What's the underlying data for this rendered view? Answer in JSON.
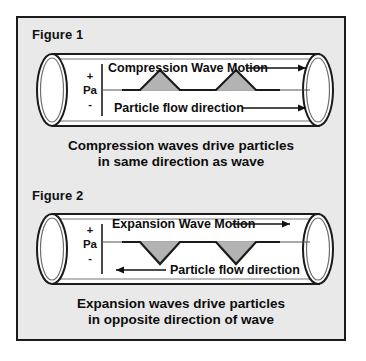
{
  "page": {
    "background": "#ffffff",
    "panel_background": "#e9e9e9",
    "panel_border_color": "#1b1b1b",
    "ink_color": "#111111",
    "wave_fill_color": "#b3b3b3",
    "tube_fill_color": "#ffffff"
  },
  "figures": [
    {
      "label": "Figure 1",
      "axis": {
        "positive": "+",
        "unit": "Pa",
        "negative": "-"
      },
      "wave_label": "Compression Wave Motion",
      "wave_arrow_direction": "right",
      "flow_label": "Particle flow direction",
      "flow_arrow_direction": "right",
      "wave_shape": "peaks-up",
      "wave_peak_count": 2,
      "caption_line1": "Compression waves drive particles",
      "caption_line2": "in same direction as wave"
    },
    {
      "label": "Figure 2",
      "axis": {
        "positive": "+",
        "unit": "Pa",
        "negative": "-"
      },
      "wave_label": "Expansion Wave Motion",
      "wave_arrow_direction": "right",
      "flow_label": "Particle flow direction",
      "flow_arrow_direction": "left",
      "wave_shape": "troughs-down",
      "wave_peak_count": 2,
      "caption_line1": "Expansion waves drive particles",
      "caption_line2": "in opposite direction of wave"
    }
  ]
}
